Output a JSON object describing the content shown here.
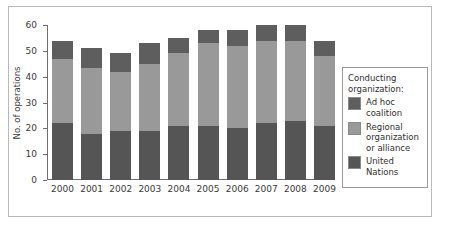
{
  "chart_data": {
    "type": "bar",
    "stacked": true,
    "title": "",
    "xlabel": "",
    "ylabel": "No. of operations",
    "ylim": [
      0,
      60
    ],
    "ytick_step": 10,
    "yticks": [
      0,
      10,
      20,
      30,
      40,
      50,
      60
    ],
    "grid": false,
    "legend_position": "right",
    "legend_title": "Conducting organization:",
    "categories": [
      "2000",
      "2001",
      "2002",
      "2003",
      "2004",
      "2005",
      "2006",
      "2007",
      "2008",
      "2009"
    ],
    "series": [
      {
        "name": "United Nations",
        "color": "#555555",
        "values": [
          22,
          18,
          19,
          19,
          21,
          21,
          20,
          22,
          23,
          21
        ]
      },
      {
        "name": "Regional organization or alliance",
        "color": "#999999",
        "values": [
          25,
          25.5,
          23,
          26,
          28,
          32,
          32,
          32,
          31,
          27
        ]
      },
      {
        "name": "Ad hoc coalition",
        "color": "#5e5e5e",
        "values": [
          7,
          7.5,
          7,
          8,
          6,
          5,
          6,
          6,
          6,
          6
        ]
      }
    ],
    "totals": [
      54,
      51,
      49,
      53,
      55,
      58,
      58,
      60,
      60,
      54
    ]
  },
  "legend": {
    "title_line1": "Conducting",
    "title_line2": "organization:",
    "entries": [
      {
        "label": "Ad hoc coalition",
        "color": "#5e5e5e"
      },
      {
        "label": "Regional organization or alliance",
        "color": "#999999"
      },
      {
        "label": "United Nations",
        "color": "#555555"
      }
    ]
  },
  "axes": {
    "y_title": "No. of operations",
    "y_labels": [
      "60",
      "50",
      "40",
      "30",
      "20",
      "10",
      "0"
    ],
    "x_labels": [
      "2000",
      "2001",
      "2002",
      "2003",
      "2004",
      "2005",
      "2006",
      "2007",
      "2008",
      "2009"
    ]
  }
}
